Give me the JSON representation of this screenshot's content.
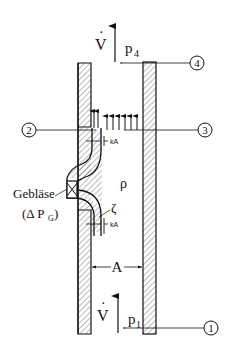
{
  "diagram": {
    "flow_symbol": "V̇",
    "flow_dot": "·",
    "flow_letter": "V",
    "pressures": {
      "top": {
        "base": "p",
        "sub": "4"
      },
      "bottom": {
        "base": "p",
        "sub": "1"
      }
    },
    "station_markers": [
      {
        "id": "1",
        "label": "1"
      },
      {
        "id": "2",
        "label": "2"
      },
      {
        "id": "3",
        "label": "3"
      },
      {
        "id": "4",
        "label": "4"
      }
    ],
    "density_label": "ρ",
    "loss_coefficient_label": "ζ",
    "nozzle_area_label_top": "kA",
    "nozzle_area_label_bottom": "kA",
    "shaft_area_label": "A",
    "fan": {
      "name": "Gebläse",
      "pressure_open": "(Δ P",
      "pressure_sub": "G",
      "pressure_close": ")"
    },
    "colors": {
      "line": "#111111",
      "hatch": "#555555",
      "background": "#ffffff"
    }
  }
}
